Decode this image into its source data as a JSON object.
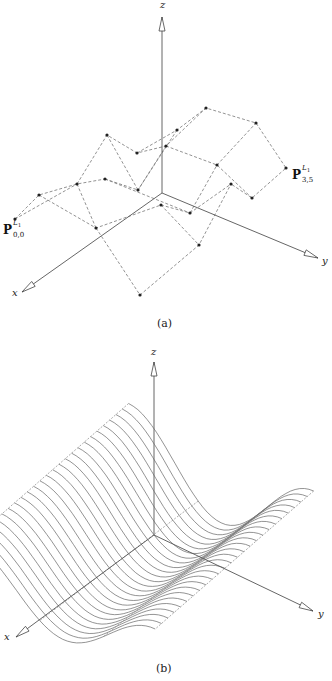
{
  "figure_a": {
    "caption": "(a)",
    "axes": {
      "x_label": "x",
      "y_label": "y",
      "z_label": "z",
      "origin": [
        162,
        193
      ],
      "x_tip": [
        22,
        292
      ],
      "y_tip": [
        318,
        258
      ],
      "z_tip": [
        162,
        17
      ]
    },
    "label_p00": {
      "base": "P",
      "sup": "L",
      "sup_sub": "1",
      "sub": "0,0"
    },
    "label_p35": {
      "base": "P",
      "sup": "L",
      "sup_sub": "1",
      "sub": "3,5"
    },
    "control_points": [
      [
        [
          15,
          219
        ],
        [
          39,
          195
        ],
        [
          77,
          184
        ],
        [
          105,
          179
        ],
        [
          138,
          190
        ],
        [
          161,
          205
        ]
      ],
      [
        [
          96,
          228
        ],
        [
          137,
          153
        ],
        [
          107,
          135
        ],
        [
          166,
          146
        ],
        [
          177,
          130
        ],
        [
          206,
          108
        ]
      ],
      [
        [
          140,
          295
        ],
        [
          199,
          245
        ],
        [
          190,
          213
        ],
        [
          217,
          165
        ],
        [
          231,
          184
        ],
        [
          256,
          123
        ]
      ],
      [
        [
          140,
          295
        ],
        [
          199,
          245
        ],
        [
          231,
          184
        ],
        [
          252,
          198
        ],
        [
          286,
          168
        ],
        [
          256,
          123
        ]
      ]
    ],
    "points": [
      [
        15,
        219
      ],
      [
        39,
        195
      ],
      [
        77,
        184
      ],
      [
        105,
        179
      ],
      [
        107,
        135
      ],
      [
        137,
        153
      ],
      [
        138,
        190
      ],
      [
        96,
        228
      ],
      [
        161,
        205
      ],
      [
        166,
        146
      ],
      [
        177,
        130
      ],
      [
        206,
        108
      ],
      [
        256,
        123
      ],
      [
        286,
        168
      ],
      [
        252,
        198
      ],
      [
        231,
        184
      ],
      [
        217,
        165
      ],
      [
        190,
        213
      ],
      [
        199,
        245
      ],
      [
        140,
        295
      ]
    ],
    "edges": [
      [
        [
          15,
          219
        ],
        [
          39,
          195
        ],
        [
          77,
          184
        ],
        [
          105,
          179
        ]
      ],
      [
        [
          15,
          219
        ],
        [
          77,
          184
        ]
      ],
      [
        [
          39,
          195
        ],
        [
          96,
          228
        ],
        [
          161,
          205
        ]
      ],
      [
        [
          77,
          184
        ],
        [
          107,
          135
        ],
        [
          137,
          153
        ],
        [
          166,
          146
        ],
        [
          206,
          108
        ],
        [
          256,
          123
        ],
        [
          286,
          168
        ],
        [
          252,
          198
        ],
        [
          231,
          184
        ]
      ],
      [
        [
          105,
          179
        ],
        [
          190,
          213
        ]
      ],
      [
        [
          105,
          179
        ],
        [
          138,
          190
        ]
      ],
      [
        [
          107,
          135
        ],
        [
          138,
          190
        ]
      ],
      [
        [
          137,
          153
        ],
        [
          177,
          130
        ],
        [
          206,
          108
        ]
      ],
      [
        [
          166,
          146
        ],
        [
          217,
          165
        ],
        [
          252,
          198
        ]
      ],
      [
        [
          138,
          190
        ],
        [
          166,
          146
        ]
      ],
      [
        [
          161,
          205
        ],
        [
          190,
          213
        ],
        [
          231,
          184
        ]
      ],
      [
        [
          96,
          228
        ],
        [
          140,
          295
        ],
        [
          199,
          245
        ],
        [
          231,
          184
        ]
      ],
      [
        [
          161,
          205
        ],
        [
          199,
          245
        ]
      ],
      [
        [
          190,
          213
        ],
        [
          217,
          165
        ],
        [
          256,
          123
        ]
      ],
      [
        [
          96,
          228
        ],
        [
          77,
          184
        ]
      ],
      [
        [
          177,
          130
        ],
        [
          138,
          190
        ]
      ]
    ]
  },
  "figure_b": {
    "caption": "(b)",
    "axes": {
      "x_label": "x",
      "y_label": "y",
      "z_label": "z",
      "origin": [
        154,
        535
      ],
      "x_tip": [
        16,
        637
      ],
      "y_tip": [
        313,
        611
      ],
      "z_tip": [
        154,
        362
      ]
    },
    "surface": {
      "curve_count": 26,
      "description": "swept wave-shaped surface drawn as family of curves"
    }
  }
}
